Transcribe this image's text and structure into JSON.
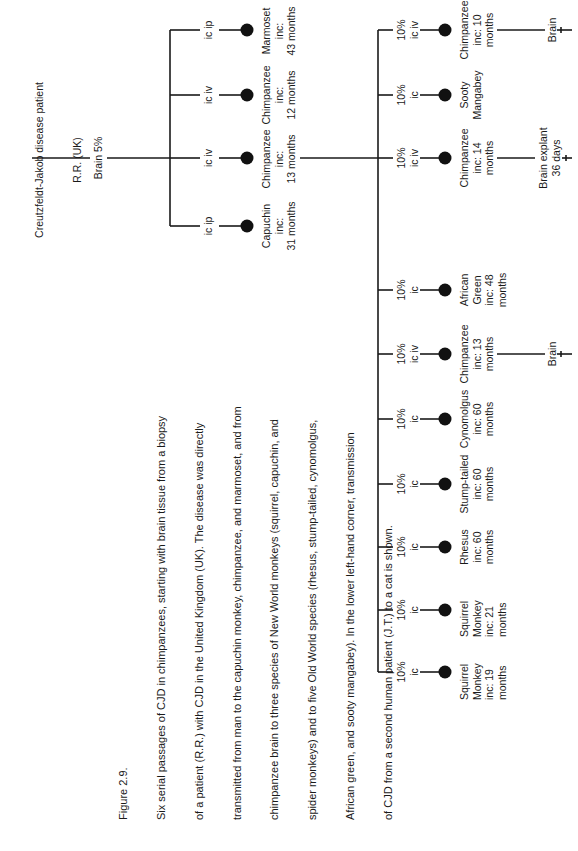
{
  "figure": {
    "orientation": "rotated 90 degrees counter-clockwise",
    "caption_title": "Figure 2.9.",
    "caption_lines": [
      "Six serial passages of CJD in chimpanzees, starting with brain tissue from a biopsy",
      "of a patient (R.R.) with CJD in the United Kingdom (UK). The disease was directly",
      "transmitted from man to the capuchin monkey, chimpanzee, and marmoset, and from",
      "chimpanzee brain to three species of New World monkeys (squirrel, capuchin, and",
      "spider monkeys) and to five Old World species (rhesus, stump-tailed, cynomolgus,",
      "African green, and sooty mangabey). In the lower left-hand corner, transmission",
      "of CJD from a second human patient (J.T.) to a cat is shown."
    ]
  },
  "root": {
    "line1": "Creutzfeldt-Jakob disease patient",
    "line2": "R.R. (UK)",
    "inoculum": "Brain 5%"
  },
  "first_passage": [
    {
      "route": "ic ip",
      "animal": "Capuchin\ninc:\n31 months"
    },
    {
      "route": "ic iv",
      "animal": "Chimpanzee\ninc:\n13 months"
    },
    {
      "route": "ic iv",
      "animal": "Chimpanzee\ninc:\n12 months"
    },
    {
      "route": "ic ip",
      "animal": "Marmoset\ninc:\n43 months"
    }
  ],
  "second_passage": [
    {
      "route": "10%\nic",
      "animal": "Squirrel\nMonkey\ninc: 19\nmonths"
    },
    {
      "route": "10%\nic",
      "animal": "Squirrel\nMonkey\ninc: 21\nmonths"
    },
    {
      "route": "10%\nic",
      "animal": "Rhesus\ninc: 60\nmonths"
    },
    {
      "route": "10%\nic",
      "animal": "Stump-tailed\ninc: 60\nmonths"
    },
    {
      "route": "10%\nic",
      "animal": "Cynomolgus\ninc: 60\nmonths"
    },
    {
      "route": "10%\nic iv",
      "animal": "Chimpanzee\ninc: 13\nmonths",
      "next": "Brain"
    },
    {
      "route": "10%\nic",
      "animal": "African\nGreen\ninc: 48\nmonths"
    },
    {
      "route": "10%\nic iv",
      "animal": "Chimpanzee\ninc: 14\nmonths",
      "next": "Brain explant\n36 days"
    },
    {
      "route": "10%\nic",
      "animal": "Sooty\nMangabey"
    },
    {
      "route": "10%\nic iv",
      "animal": "Chimpanzee\ninc: 10\nmonths",
      "next": "Brain"
    }
  ],
  "colors": {
    "ink": "#1a1a1a",
    "background": "#ffffff"
  }
}
